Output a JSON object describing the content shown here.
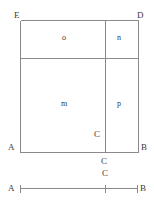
{
  "figure": {
    "title": "",
    "vertices": [
      {
        "name": "E",
        "label": "E",
        "x": 14,
        "y": 11
      },
      {
        "name": "D",
        "label": "D",
        "x": 137,
        "y": 11
      },
      {
        "name": "A",
        "label": "A",
        "x": 8,
        "y": 143
      },
      {
        "name": "B",
        "label": "B",
        "x": 141,
        "y": 143
      },
      {
        "name": "C-inside",
        "label": "C",
        "x": 94,
        "y": 130
      },
      {
        "name": "C-below",
        "label": "C",
        "x": 101,
        "y": 157
      }
    ],
    "regions": [
      {
        "name": "o",
        "label": "o",
        "x": 62,
        "y": 34
      },
      {
        "name": "n",
        "label": "n",
        "x": 117,
        "y": 34
      },
      {
        "name": "m",
        "label": "m",
        "x": 61,
        "y": 100
      },
      {
        "name": "p",
        "label": "p",
        "x": 117,
        "y": 100
      }
    ],
    "segment": {
      "left_label": "A",
      "right_label": "B",
      "mid_label": "C",
      "left_label_x": 8,
      "right_label_x": 140,
      "mid_label_x": 102,
      "label_y": 184,
      "mid_label_y": 169
    },
    "colors": {
      "line": "#8a8a8a",
      "text": "#3a3a3a",
      "background": "#ffffff"
    },
    "geometry": {
      "rect_left": 20,
      "rect_right": 138,
      "rect_top": 20,
      "rect_bottom": 152,
      "h_divider_y": 58,
      "v_divider_x": 105,
      "segment_y": 188,
      "segment_left_x": 20,
      "segment_right_x": 137,
      "segment_mid_x": 105,
      "tick_half_height": 4
    }
  }
}
